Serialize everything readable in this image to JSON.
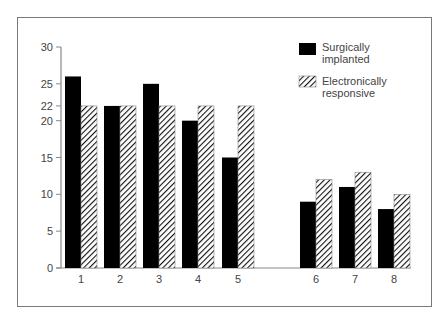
{
  "chart_data": {
    "type": "bar",
    "title": "",
    "xlabel": "",
    "ylabel": "",
    "categories": [
      "1",
      "2",
      "3",
      "4",
      "5",
      "6",
      "7",
      "8"
    ],
    "series": [
      {
        "name": "Surgically implanted",
        "fill": "solid",
        "color": "#000000",
        "values": [
          26,
          22,
          25,
          20,
          15,
          9,
          11,
          8
        ]
      },
      {
        "name": "Electronically responsive",
        "fill": "hatched",
        "color": "#000000",
        "values": [
          22,
          22,
          22,
          22,
          22,
          12,
          13,
          10
        ]
      }
    ],
    "yticks": [
      0,
      5,
      10,
      15,
      20,
      22,
      25,
      30
    ],
    "ylim": [
      0,
      30
    ],
    "grid": false,
    "legend_position": "top-right",
    "group_gap_after": "5"
  },
  "legend": {
    "items": [
      {
        "line1": "Surgically",
        "line2": "implanted"
      },
      {
        "line1": "Electronically",
        "line2": "responsive"
      }
    ]
  }
}
